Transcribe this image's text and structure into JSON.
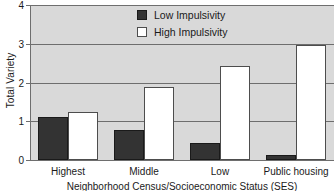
{
  "chart_data": {
    "type": "bar",
    "title": "",
    "xlabel": "Neighborhood Census/Socioeconomic Status (SES)",
    "ylabel": "Total Variety",
    "categories": [
      "Highest",
      "Middle",
      "Low",
      "Public housing"
    ],
    "series": [
      {
        "name": "Low Impulsivity",
        "values": [
          1.1,
          0.78,
          0.44,
          0.13
        ],
        "color": "#333333"
      },
      {
        "name": "High Impulsivity",
        "values": [
          1.25,
          1.88,
          2.42,
          2.97
        ],
        "color": "#ffffff"
      }
    ],
    "ylim": [
      0,
      4
    ],
    "yticks": [
      "0",
      "1",
      "2",
      "3",
      "4"
    ],
    "grid": true,
    "legend_position": "top-center",
    "plot_background": "#d9d9d9"
  },
  "axes": {
    "y_title": "Total Variety",
    "x_title": "Neighborhood Census/Socioeconomic Status (SES)",
    "y_tick_0": "0",
    "y_tick_1": "1",
    "y_tick_2": "2",
    "y_tick_3": "3",
    "y_tick_4": "4"
  },
  "legend": {
    "items": [
      {
        "label": "Low Impulsivity"
      },
      {
        "label": "High Impulsivity"
      }
    ]
  },
  "categories": {
    "c0": "Highest",
    "c1": "Middle",
    "c2": "Low",
    "c3": "Public housing"
  }
}
